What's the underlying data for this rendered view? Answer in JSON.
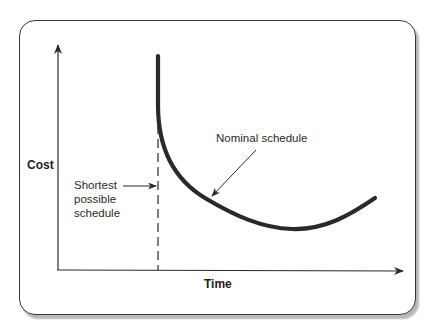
{
  "diagram": {
    "type": "cost-vs-time schedule curve",
    "axes": {
      "x_label": "Time",
      "y_label": "Cost"
    },
    "annotations": {
      "shortest": [
        "Shortest",
        "possible",
        "schedule"
      ],
      "nominal": "Nominal schedule"
    },
    "colors": {
      "curve": "#2a2a2a",
      "axis": "#2a2a2a",
      "frame": "#3a3a3a",
      "shadow": "#b8b8b8"
    },
    "curve_points": [
      [
        158,
        56
      ],
      [
        158,
        110
      ],
      [
        165,
        145
      ],
      [
        180,
        172
      ],
      [
        200,
        192
      ],
      [
        225,
        210
      ],
      [
        255,
        222
      ],
      [
        290,
        229
      ],
      [
        325,
        226
      ],
      [
        355,
        213
      ],
      [
        375,
        198
      ]
    ]
  }
}
